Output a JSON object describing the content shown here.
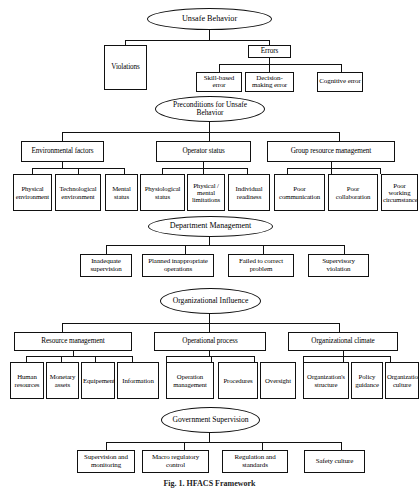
{
  "figure": {
    "caption": "Fig. 1. HFACS Framework"
  },
  "levels": {
    "level1": {
      "root_label": "Unsafe Behavior",
      "nodes": [
        {
          "label": "Violations"
        },
        {
          "label": "Errors"
        }
      ],
      "error_children": [
        {
          "label": "Skill-based error"
        },
        {
          "label": "Decision-making error"
        },
        {
          "label": "Cognitive error"
        }
      ]
    },
    "level2": {
      "root_label": "Preconditions for Unsafe Behavior",
      "groups": [
        {
          "label": "Environmental factors",
          "children": [
            {
              "label": "Physical environment"
            },
            {
              "label": "Technological environment"
            },
            {
              "label": "Mental status"
            }
          ]
        },
        {
          "label": "Operator status",
          "children": [
            {
              "label": "Physiological status"
            },
            {
              "label": "Physical / mental limitations"
            },
            {
              "label": "Individual readiness"
            }
          ]
        },
        {
          "label": "Group resource management",
          "children": [
            {
              "label": "Poor communication"
            },
            {
              "label": "Poor collaboration"
            },
            {
              "label": "Poor working circumstance"
            }
          ]
        }
      ]
    },
    "level3": {
      "root_label": "Department Management",
      "children": [
        {
          "label": "Inadequate supervision"
        },
        {
          "label": "Planned inappropriate operations"
        },
        {
          "label": "Failed to correct problem"
        },
        {
          "label": "Supervisory violation"
        }
      ]
    },
    "level4": {
      "root_label": "Organizational Influence",
      "groups": [
        {
          "label": "Resource management",
          "children": [
            {
              "label": "Human resources"
            },
            {
              "label": "Monetary assets"
            },
            {
              "label": "Equipement"
            },
            {
              "label": "Information"
            }
          ]
        },
        {
          "label": "Operational process",
          "children": [
            {
              "label": "Operation management"
            },
            {
              "label": "Procedures"
            },
            {
              "label": "Oversight"
            }
          ]
        },
        {
          "label": "Organizational climate",
          "children": [
            {
              "label": "Organization's structure"
            },
            {
              "label": "Policy guidance"
            },
            {
              "label": "Organizational culture"
            }
          ]
        }
      ]
    },
    "level5": {
      "root_label": "Government Supervision",
      "children": [
        {
          "label": "Supervision and monitoring"
        },
        {
          "label": "Macro regulatory control"
        },
        {
          "label": "Regulation and standards"
        },
        {
          "label": "Safety culture"
        }
      ]
    }
  }
}
